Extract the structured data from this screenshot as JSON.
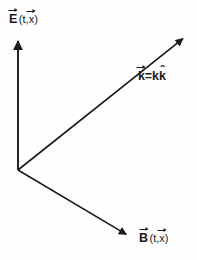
{
  "figure": {
    "type": "vector-diagram",
    "background_color": "#fefefe",
    "stroke_color": "#1a1a1a",
    "width": 197,
    "height": 260
  },
  "origin": {
    "x": 18,
    "y": 170
  },
  "vectors": [
    {
      "id": "e-field",
      "name": "electric-field-vector",
      "from": {
        "x": 18,
        "y": 170
      },
      "to": {
        "x": 18,
        "y": 32
      },
      "direction": "up",
      "label": {
        "symbol": "E",
        "accent": "arrow",
        "argument_open": "(t,",
        "argument_symbol": "x",
        "argument_accent": "arrow",
        "argument_close": ")",
        "full_text": "E⃗ (t,x⃗)"
      }
    },
    {
      "id": "k-vector",
      "name": "wave-vector",
      "from": {
        "x": 18,
        "y": 170
      },
      "to": {
        "x": 190,
        "y": 33
      },
      "direction": "upper-right",
      "label": {
        "symbol": "k",
        "accent": "arrow",
        "equals": "=",
        "scalar": "k",
        "unit_symbol": "k",
        "unit_accent": "hat",
        "full_text": "k⃗=k k̂"
      }
    },
    {
      "id": "b-field",
      "name": "magnetic-field-vector",
      "from": {
        "x": 18,
        "y": 170
      },
      "to": {
        "x": 134,
        "y": 239
      },
      "direction": "lower-right",
      "label": {
        "symbol": "B",
        "accent": "arrow",
        "argument_open": "(t,",
        "argument_symbol": "x",
        "argument_accent": "arrow",
        "argument_close": ")",
        "full_text": "B⃗ (t,x⃗)"
      }
    }
  ],
  "accents": {
    "hat_glyph": "ˆ"
  }
}
